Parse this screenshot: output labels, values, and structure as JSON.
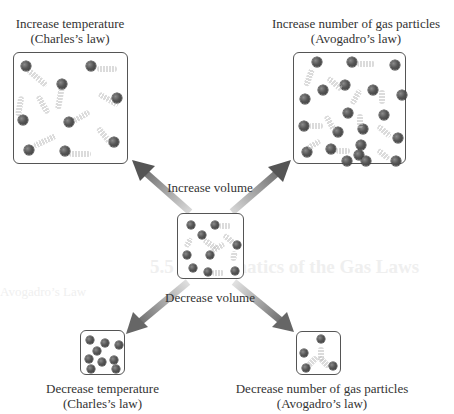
{
  "diagram": {
    "center": {
      "label_top": "Increase volume",
      "label_bottom": "Decrease volume"
    },
    "top_left": {
      "title": "Increase temperature",
      "subtitle": "(Charles’s law)"
    },
    "top_right": {
      "title": "Increase number of gas particles",
      "subtitle": "(Avogadro’s law)"
    },
    "bottom_left": {
      "title": "Decrease temperature",
      "subtitle": "(Charles’s law)"
    },
    "bottom_right": {
      "title": "Decrease number of gas particles",
      "subtitle": "(Avogadro’s law)"
    },
    "colors": {
      "arrow_dark": "#5a5a5a",
      "arrow_light": "#d8d8d8",
      "particle": "#4a4a4a",
      "box_border": "#555555"
    },
    "particle_counts": {
      "top_left": 10,
      "top_right": 25,
      "center": 10,
      "bottom_left": 10,
      "bottom_right": 4
    }
  },
  "bleed_text": {
    "heading": "5.5 Mathematics of the Gas Laws",
    "subheading": "Avogadro’s Law"
  }
}
